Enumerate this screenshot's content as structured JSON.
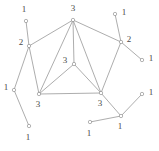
{
  "figure": {
    "width": 159,
    "height": 151,
    "background": "#ffffff",
    "edge_color": "#8a8a8a",
    "node_fill": "#ffffff",
    "node_stroke": "#8a8a8a",
    "label_color": "#4a4a4a"
  },
  "chart_data": {
    "type": "diagram",
    "title": "",
    "layout": "node-link graph with numeric vertex labels",
    "nodes": [
      {
        "id": "n1",
        "label": "1",
        "x": 26,
        "y": 21,
        "label_x": 24,
        "label_y": 10,
        "anchor": "middle"
      },
      {
        "id": "n2",
        "label": "3",
        "x": 73,
        "y": 20,
        "label_x": 73,
        "label_y": 9,
        "anchor": "middle"
      },
      {
        "id": "n3",
        "label": "1",
        "x": 115,
        "y": 14,
        "label_x": 124,
        "label_y": 13,
        "anchor": "middle"
      },
      {
        "id": "n4",
        "label": "2",
        "x": 29,
        "y": 46,
        "label_x": 21,
        "label_y": 43,
        "anchor": "middle"
      },
      {
        "id": "n5",
        "label": "2",
        "x": 121,
        "y": 42,
        "label_x": 129,
        "label_y": 40,
        "anchor": "middle"
      },
      {
        "id": "n6",
        "label": "1",
        "x": 142,
        "y": 60,
        "label_x": 151,
        "label_y": 59,
        "anchor": "middle"
      },
      {
        "id": "n7",
        "label": "3",
        "x": 74,
        "y": 64,
        "label_x": 65,
        "label_y": 61,
        "anchor": "middle"
      },
      {
        "id": "n8",
        "label": "1",
        "x": 14,
        "y": 90,
        "label_x": 6,
        "label_y": 88,
        "anchor": "middle"
      },
      {
        "id": "n9",
        "label": "3",
        "x": 39,
        "y": 94,
        "label_x": 38,
        "label_y": 105,
        "anchor": "middle"
      },
      {
        "id": "n10",
        "label": "3",
        "x": 101,
        "y": 93,
        "label_x": 100,
        "label_y": 104,
        "anchor": "middle"
      },
      {
        "id": "n11",
        "label": "1",
        "x": 142,
        "y": 94,
        "label_x": 151,
        "label_y": 93,
        "anchor": "middle"
      },
      {
        "id": "n12",
        "label": "1",
        "x": 121,
        "y": 116,
        "label_x": 120,
        "label_y": 127,
        "anchor": "middle"
      },
      {
        "id": "n13",
        "label": "1",
        "x": 90,
        "y": 122,
        "label_x": 89,
        "label_y": 134,
        "anchor": "middle"
      },
      {
        "id": "n14",
        "label": "1",
        "x": 29,
        "y": 126,
        "label_x": 28,
        "label_y": 138,
        "anchor": "middle"
      }
    ],
    "edges": [
      {
        "from": "n1",
        "to": "n4"
      },
      {
        "from": "n4",
        "to": "n2"
      },
      {
        "from": "n4",
        "to": "n8"
      },
      {
        "from": "n4",
        "to": "n9"
      },
      {
        "from": "n8",
        "to": "n14"
      },
      {
        "from": "n2",
        "to": "n9"
      },
      {
        "from": "n2",
        "to": "n7"
      },
      {
        "from": "n2",
        "to": "n10"
      },
      {
        "from": "n2",
        "to": "n5"
      },
      {
        "from": "n7",
        "to": "n9"
      },
      {
        "from": "n7",
        "to": "n10"
      },
      {
        "from": "n9",
        "to": "n10"
      },
      {
        "from": "n3",
        "to": "n5"
      },
      {
        "from": "n5",
        "to": "n6"
      },
      {
        "from": "n5",
        "to": "n10"
      },
      {
        "from": "n10",
        "to": "n12"
      },
      {
        "from": "n12",
        "to": "n11"
      },
      {
        "from": "n12",
        "to": "n13"
      }
    ]
  }
}
